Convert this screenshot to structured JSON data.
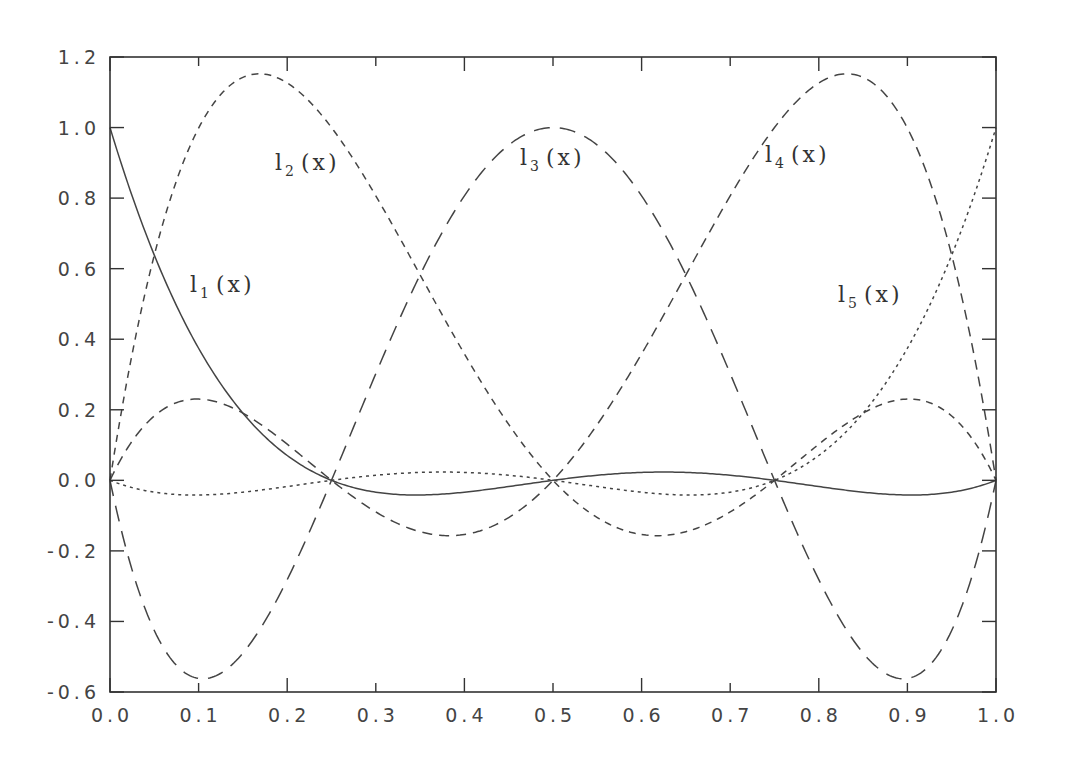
{
  "chart_data": {
    "type": "line",
    "title": "",
    "xlabel": "",
    "ylabel": "",
    "xlim": [
      0.0,
      1.0
    ],
    "ylim": [
      -0.6,
      1.2
    ],
    "grid": false,
    "legend": "none (inline curve labels)",
    "nodes": [
      0.0,
      0.25,
      0.5,
      0.75,
      1.0
    ],
    "x_ticks": [
      "0.0",
      "0.1",
      "0.2",
      "0.3",
      "0.4",
      "0.5",
      "0.6",
      "0.7",
      "0.8",
      "0.9",
      "1.0"
    ],
    "y_ticks": [
      "-0.6",
      "-0.4",
      "-0.2",
      "0.0",
      "0.2",
      "0.4",
      "0.6",
      "0.8",
      "1.0",
      "1.2"
    ],
    "x": [
      0.0,
      0.1,
      0.2,
      0.25,
      0.3,
      0.4,
      0.5,
      0.6,
      0.7,
      0.75,
      0.8,
      0.9,
      1.0
    ],
    "series": [
      {
        "name": "l1(x)",
        "style": "solid",
        "values": [
          1.0,
          0.2304,
          -0.0128,
          0.0,
          -0.0224,
          -0.0384,
          0.0,
          0.0416,
          0.0224,
          0.0,
          -0.0128,
          0.0,
          0.0
        ]
      },
      {
        "name": "l2(x)",
        "style": "short-dash",
        "values": [
          0.0,
          1.0816,
          0.8533,
          0.0,
          0.0,
          0.0,
          0.0,
          0.0,
          0.0,
          0.0,
          0.0,
          0.0,
          0.0
        ]
      },
      {
        "name": "l3(x)",
        "style": "long-dash",
        "values": [
          0.0,
          -0.5616,
          0.2688,
          0.0,
          0.4032,
          0.8064,
          1.0,
          0.8064,
          0.4032,
          0.0,
          0.2688,
          -0.5616,
          0.0
        ]
      },
      {
        "name": "l4(x)",
        "style": "dash",
        "values": [
          0.0,
          0.2304,
          0.0,
          0.0,
          -0.1344,
          -0.1408,
          0.0,
          0.6144,
          1.1776,
          1.0,
          1.1776,
          0.2304,
          0.0
        ]
      },
      {
        "name": "l5(x)",
        "style": "dotted",
        "values": [
          0.0,
          -0.0384,
          0.0224,
          0.0,
          0.0416,
          0.0416,
          0.0,
          -0.0384,
          -0.0224,
          0.0,
          0.2304,
          0.4816,
          1.0
        ]
      }
    ],
    "annotations": [
      {
        "text": "l",
        "sub": "1",
        "suffix": "(x)",
        "x": 0.09,
        "y": 0.47
      },
      {
        "text": "l",
        "sub": "2",
        "suffix": "(x)",
        "x": 0.185,
        "y": 0.93
      },
      {
        "text": "l",
        "sub": "3",
        "suffix": "(x)",
        "x": 0.475,
        "y": 0.95
      },
      {
        "text": "l",
        "sub": "4",
        "suffix": "(x)",
        "x": 0.74,
        "y": 0.95
      },
      {
        "text": "l",
        "sub": "5",
        "suffix": "(x)",
        "x": 0.835,
        "y": 0.5
      }
    ]
  },
  "labels": {
    "l1": {
      "base": "l",
      "sub": "1",
      "arg": "(x)"
    },
    "l2": {
      "base": "l",
      "sub": "2",
      "arg": "(x)"
    },
    "l3": {
      "base": "l",
      "sub": "3",
      "arg": "(x)"
    },
    "l4": {
      "base": "l",
      "sub": "4",
      "arg": "(x)"
    },
    "l5": {
      "base": "l",
      "sub": "5",
      "arg": "(x)"
    }
  }
}
